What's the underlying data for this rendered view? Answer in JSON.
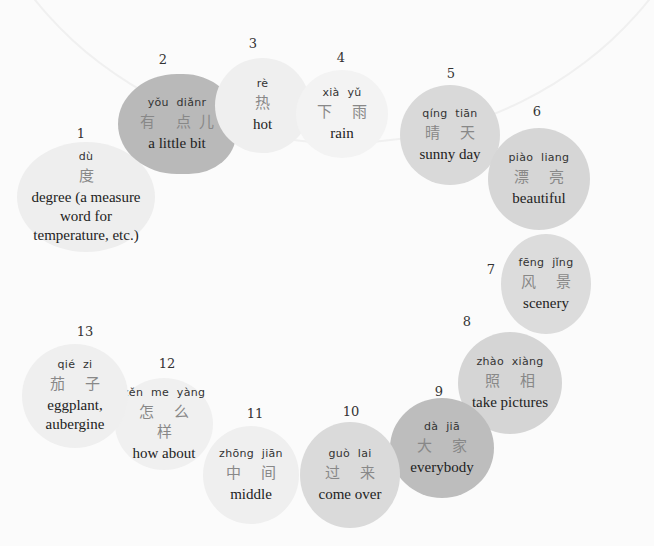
{
  "items": [
    {
      "num": "1",
      "pinyin": "dù",
      "hanzi": "度",
      "english": "degree (a measure word for temperature, etc.)",
      "color": "#eeeeee"
    },
    {
      "num": "2",
      "pinyin": "yǒu diǎnr",
      "hanzi": "有 点儿",
      "english": "a little bit",
      "color": "#b9b9b9"
    },
    {
      "num": "3",
      "pinyin": "rè",
      "hanzi": "热",
      "english": "hot",
      "color": "#efefef"
    },
    {
      "num": "4",
      "pinyin": "xià yǔ",
      "hanzi": "下 雨",
      "english": "rain",
      "color": "#f3f3f3"
    },
    {
      "num": "5",
      "pinyin": "qíng tiān",
      "hanzi": "晴 天",
      "english": "sunny day",
      "color": "#d9d9d9"
    },
    {
      "num": "6",
      "pinyin": "piào liang",
      "hanzi": "漂 亮",
      "english": "beautiful",
      "color": "#d6d6d6"
    },
    {
      "num": "7",
      "pinyin": "fēng jǐng",
      "hanzi": "风 景",
      "english": "scenery",
      "color": "#dcdcdc"
    },
    {
      "num": "8",
      "pinyin": "zhào xiàng",
      "hanzi": "照 相",
      "english": "take pictures",
      "color": "#d5d5d5"
    },
    {
      "num": "9",
      "pinyin": "dà jiā",
      "hanzi": "大 家",
      "english": "everybody",
      "color": "#bdbdbd"
    },
    {
      "num": "10",
      "pinyin": "guò lai",
      "hanzi": "过 来",
      "english": "come over",
      "color": "#dadada"
    },
    {
      "num": "11",
      "pinyin": "zhōng jiān",
      "hanzi": "中 间",
      "english": "middle",
      "color": "#efefef"
    },
    {
      "num": "12",
      "pinyin": "zěn me yàng",
      "hanzi": "怎 么 样",
      "english": "how about",
      "color": "#f0f0f0"
    },
    {
      "num": "13",
      "pinyin": "qié zi",
      "hanzi": "茄 子",
      "english": "eggplant, aubergine",
      "color": "#efefef"
    }
  ]
}
